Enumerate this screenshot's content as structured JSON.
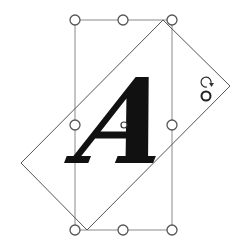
{
  "canvas": {
    "width": 244,
    "height": 244,
    "background": "#ffffff"
  },
  "text_object": {
    "letter": "A",
    "color": "#111111"
  },
  "bounding_box": {
    "x": 75,
    "y": 20,
    "width": 97,
    "height": 210,
    "stroke": "#888888"
  },
  "rotated_frame": {
    "points": "163,20 230,86 87,230 21,163",
    "stroke": "#555555"
  },
  "handles": [
    {
      "name": "top-left",
      "cx": 75,
      "cy": 20
    },
    {
      "name": "top-center",
      "cx": 123,
      "cy": 20
    },
    {
      "name": "top-right",
      "cx": 172,
      "cy": 20
    },
    {
      "name": "middle-left",
      "cx": 75,
      "cy": 125
    },
    {
      "name": "middle-right",
      "cx": 172,
      "cy": 125
    },
    {
      "name": "bottom-left",
      "cx": 75,
      "cy": 230
    },
    {
      "name": "bottom-center",
      "cx": 123,
      "cy": 230
    },
    {
      "name": "bottom-right",
      "cx": 172,
      "cy": 230
    }
  ],
  "center_handle": {
    "cx": 124,
    "cy": 125
  },
  "rotation_handle": {
    "cx": 206,
    "cy": 96,
    "icon": "rotate-icon"
  }
}
